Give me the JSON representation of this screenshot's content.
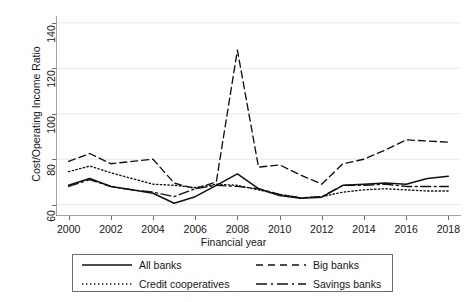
{
  "chart_data": {
    "type": "line",
    "title": "",
    "xlabel": "Financial year",
    "ylabel": "Cost/Operating Income Ratio",
    "xlim": [
      1999.4,
      2018.6
    ],
    "ylim": [
      55,
      143
    ],
    "xticks": [
      2000,
      2002,
      2004,
      2006,
      2008,
      2010,
      2012,
      2014,
      2016,
      2018
    ],
    "yticks": [
      60,
      80,
      100,
      120,
      140
    ],
    "grid": "horizontal",
    "legend_position": "below-plot",
    "x": [
      2000,
      2001,
      2002,
      2003,
      2004,
      2005,
      2006,
      2007,
      2008,
      2009,
      2010,
      2011,
      2012,
      2013,
      2014,
      2015,
      2016,
      2017,
      2018
    ],
    "series": [
      {
        "name": "All banks",
        "style": "solid",
        "values": [
          68.5,
          71.5,
          68.0,
          66.5,
          65.0,
          60.6,
          63.5,
          68.5,
          73.5,
          67.0,
          64.0,
          62.8,
          63.3,
          68.5,
          69.0,
          69.5,
          69.0,
          71.5,
          72.5
        ]
      },
      {
        "name": "Big banks",
        "style": "dashed",
        "values": [
          79.0,
          82.5,
          78.0,
          79.0,
          80.0,
          69.5,
          67.0,
          70.0,
          128.0,
          76.5,
          77.5,
          73.0,
          69.0,
          78.0,
          80.0,
          84.0,
          88.5,
          88.0,
          87.5
        ]
      },
      {
        "name": "Credit cooperatives",
        "style": "dotted",
        "values": [
          74.5,
          77.0,
          74.0,
          71.5,
          69.0,
          68.5,
          67.5,
          69.0,
          68.5,
          66.5,
          64.5,
          63.0,
          63.5,
          65.5,
          66.5,
          67.0,
          66.5,
          66.0,
          66.0
        ]
      },
      {
        "name": "Savings banks",
        "style": "dash-dot",
        "values": [
          68.0,
          71.0,
          68.0,
          66.5,
          65.5,
          63.5,
          67.0,
          68.5,
          68.0,
          67.0,
          64.5,
          63.0,
          63.5,
          68.5,
          68.5,
          69.0,
          68.0,
          68.0,
          68.0
        ]
      }
    ]
  },
  "legend": {
    "entries": [
      {
        "label": "All banks",
        "style": "solid"
      },
      {
        "label": "Big banks",
        "style": "dashed"
      },
      {
        "label": "Credit cooperatives",
        "style": "dotted"
      },
      {
        "label": "Savings banks",
        "style": "dash-dot"
      }
    ]
  }
}
